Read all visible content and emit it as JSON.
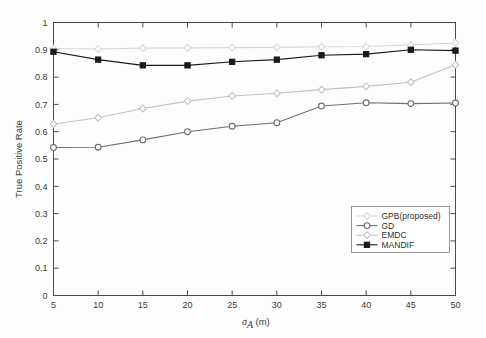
{
  "chart_data": {
    "type": "line",
    "title": "",
    "xlabel": "σₐ(m)",
    "xlabel_base": "σ",
    "xlabel_sub": "A",
    "xlabel_unit": "(m)",
    "ylabel": "True Positive Rate",
    "x": [
      5,
      10,
      15,
      20,
      25,
      30,
      35,
      40,
      45,
      50
    ],
    "xlim": [
      5,
      50
    ],
    "ylim": [
      0,
      1
    ],
    "xticks": [
      5,
      10,
      15,
      20,
      25,
      30,
      35,
      40,
      45,
      50
    ],
    "yticks": [
      0,
      0.1,
      0.2,
      0.3,
      0.4,
      0.5,
      0.6,
      0.7,
      0.8,
      0.9,
      1
    ],
    "ytick_labels": [
      "0",
      "0.1",
      "0.2",
      "0.3",
      "0.4",
      "0.5",
      "0.6",
      "0.7",
      "0.8",
      "0.9",
      "1"
    ],
    "xtick_labels": [
      "5",
      "10",
      "15",
      "20",
      "25",
      "30",
      "35",
      "40",
      "45",
      "50"
    ],
    "grid": false,
    "legend_position": "lower right",
    "series": [
      {
        "name": "GPB(proposed)",
        "color": "#d8d8d8",
        "marker": "diamond",
        "filled": false,
        "values": [
          0.905,
          0.903,
          0.906,
          0.907,
          0.908,
          0.909,
          0.911,
          0.912,
          0.918,
          0.925
        ]
      },
      {
        "name": "GD",
        "color": "#6e6e6e",
        "marker": "circle",
        "filled": false,
        "values": [
          0.542,
          0.543,
          0.57,
          0.6,
          0.62,
          0.633,
          0.694,
          0.706,
          0.703,
          0.705
        ]
      },
      {
        "name": "EMDC",
        "color": "#c2c2c2",
        "marker": "diamond",
        "filled": false,
        "values": [
          0.628,
          0.651,
          0.685,
          0.712,
          0.731,
          0.741,
          0.754,
          0.766,
          0.781,
          0.845
        ]
      },
      {
        "name": "MANDIF",
        "color": "#1a1a1a",
        "marker": "square",
        "filled": true,
        "values": [
          0.893,
          0.864,
          0.843,
          0.843,
          0.856,
          0.864,
          0.88,
          0.884,
          0.9,
          0.897
        ]
      }
    ]
  },
  "legend": {
    "entries": [
      {
        "label": "GPB(proposed)"
      },
      {
        "label": "GD"
      },
      {
        "label": "EMDC"
      },
      {
        "label": "MANDIF"
      }
    ]
  }
}
